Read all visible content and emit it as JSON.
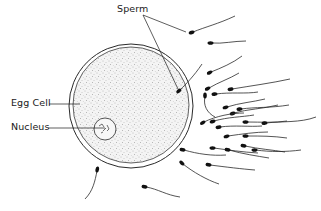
{
  "diagram": {
    "labels": {
      "sperm": "Sperm",
      "egg_cell": "Egg Cell",
      "nucleus": "Nucleus"
    },
    "colors": {
      "ink": "#1a1a1a",
      "background": "#ffffff",
      "cytoplasm_stipple": "#8a8a8a"
    },
    "sperm_count": 27
  }
}
